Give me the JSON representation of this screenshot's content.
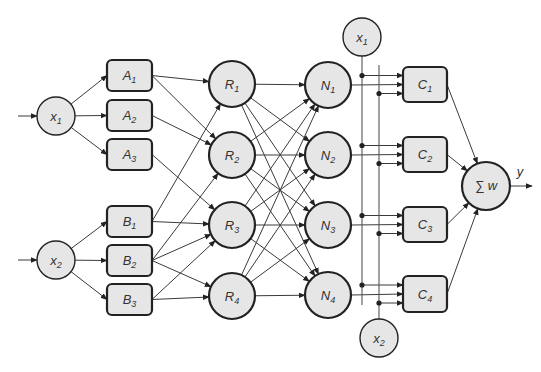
{
  "colors": {
    "node_fill": "#e6e6e6",
    "node_stroke": "#222222",
    "edge": "#3a3a3a",
    "background": "#ffffff"
  },
  "inputs": [
    {
      "id": "x1",
      "base": "x",
      "sub": "1",
      "cx": 56,
      "cy": 116,
      "r": 19
    },
    {
      "id": "x2",
      "base": "x",
      "sub": "2",
      "cx": 56,
      "cy": 260,
      "r": 19
    }
  ],
  "fuzzy_sets": [
    {
      "id": "A1",
      "base": "A",
      "sub": "1",
      "x": 107,
      "y": 60,
      "w": 45,
      "h": 31,
      "input": "x1"
    },
    {
      "id": "A2",
      "base": "A",
      "sub": "2",
      "x": 107,
      "y": 100,
      "w": 45,
      "h": 31,
      "input": "x1"
    },
    {
      "id": "A3",
      "base": "A",
      "sub": "3",
      "x": 107,
      "y": 139,
      "w": 45,
      "h": 31,
      "input": "x1"
    },
    {
      "id": "B1",
      "base": "B",
      "sub": "1",
      "x": 107,
      "y": 206,
      "w": 45,
      "h": 31,
      "input": "x2"
    },
    {
      "id": "B2",
      "base": "B",
      "sub": "2",
      "x": 107,
      "y": 245,
      "w": 45,
      "h": 31,
      "input": "x2"
    },
    {
      "id": "B3",
      "base": "B",
      "sub": "3",
      "x": 107,
      "y": 284,
      "w": 45,
      "h": 31,
      "input": "x2"
    }
  ],
  "rules": [
    {
      "id": "R1",
      "base": "R",
      "sub": "1",
      "cx": 232,
      "cy": 84,
      "r": 23
    },
    {
      "id": "R2",
      "base": "R",
      "sub": "2",
      "cx": 232,
      "cy": 155,
      "r": 23
    },
    {
      "id": "R3",
      "base": "R",
      "sub": "3",
      "cx": 232,
      "cy": 225,
      "r": 23
    },
    {
      "id": "R4",
      "base": "R",
      "sub": "4",
      "cx": 232,
      "cy": 296,
      "r": 23
    }
  ],
  "norm": [
    {
      "id": "N1",
      "base": "N",
      "sub": "1",
      "cx": 328,
      "cy": 85,
      "r": 23
    },
    {
      "id": "N2",
      "base": "N",
      "sub": "2",
      "cx": 328,
      "cy": 155,
      "r": 23
    },
    {
      "id": "N3",
      "base": "N",
      "sub": "3",
      "cx": 328,
      "cy": 225,
      "r": 23
    },
    {
      "id": "N4",
      "base": "N",
      "sub": "4",
      "cx": 328,
      "cy": 295,
      "r": 23
    }
  ],
  "consequents": [
    {
      "id": "C1",
      "base": "C",
      "sub": "1",
      "x": 403,
      "y": 67,
      "w": 44,
      "h": 35
    },
    {
      "id": "C2",
      "base": "C",
      "sub": "2",
      "x": 403,
      "y": 137,
      "w": 44,
      "h": 35
    },
    {
      "id": "C3",
      "base": "C",
      "sub": "3",
      "x": 403,
      "y": 207,
      "w": 44,
      "h": 35
    },
    {
      "id": "C4",
      "base": "C",
      "sub": "4",
      "x": 403,
      "y": 276,
      "w": 44,
      "h": 36
    }
  ],
  "bus_inputs": [
    {
      "id": "x1_top",
      "base": "x",
      "sub": "1",
      "cx": 362,
      "cy": 37,
      "r": 19,
      "line_x": 362,
      "line_y1": 56,
      "line_y2": 305
    },
    {
      "id": "x2_bottom",
      "base": "x",
      "sub": "2",
      "cx": 379,
      "cy": 338,
      "r": 19,
      "line_x": 379,
      "line_y1": 65,
      "line_y2": 319
    }
  ],
  "sum_node": {
    "label": "∑ w",
    "cx": 486,
    "cy": 186,
    "r": 24
  },
  "output": {
    "label": "y",
    "x1": 510,
    "x2": 532,
    "y": 186
  },
  "edges_fuzzy_to_rule": [
    [
      "A1",
      "R1"
    ],
    [
      "A1",
      "R2"
    ],
    [
      "A2",
      "R2"
    ],
    [
      "A3",
      "R3"
    ],
    [
      "B1",
      "R1"
    ],
    [
      "B1",
      "R3"
    ],
    [
      "B2",
      "R2"
    ],
    [
      "B2",
      "R3"
    ],
    [
      "B2",
      "R4"
    ],
    [
      "B3",
      "R3"
    ],
    [
      "B3",
      "R4"
    ]
  ],
  "edges_rule_to_norm": "fully-connected"
}
